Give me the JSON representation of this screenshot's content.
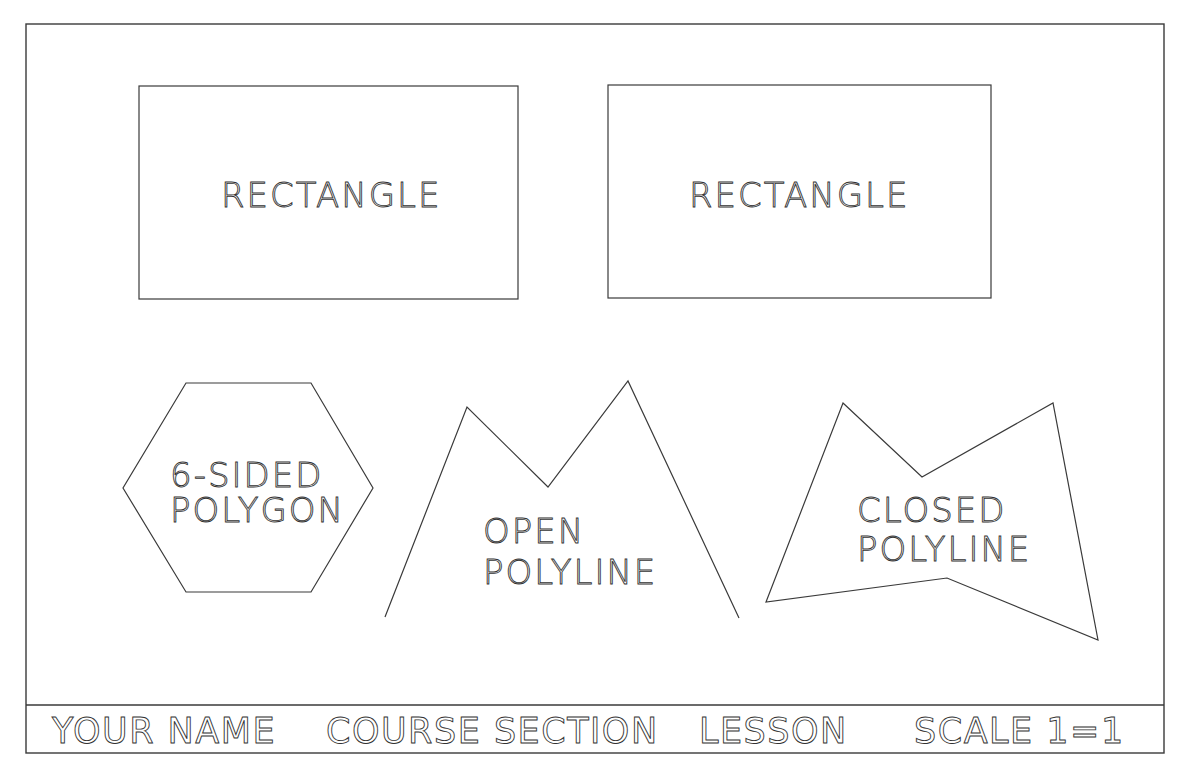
{
  "drawing": {
    "line_color": "#3a3a3a",
    "background": "#ffffff",
    "border": {
      "x": 26,
      "y": 24,
      "width": 1138,
      "height": 729
    },
    "title_block": {
      "divider_y": 705,
      "fields": [
        {
          "label": "YOUR NAME",
          "x": 52
        },
        {
          "label": "COURSE SECTION",
          "x": 326
        },
        {
          "label": "LESSON",
          "x": 699
        },
        {
          "label": "SCALE 1=1",
          "x": 914
        }
      ],
      "baseline_y": 743
    },
    "shapes": [
      {
        "type": "rectangle",
        "label_lines": [
          "RECTANGLE"
        ],
        "rect": {
          "x": 139,
          "y": 86,
          "width": 379,
          "height": 213
        },
        "label_x": 221,
        "label_y": [
          207
        ]
      },
      {
        "type": "rectangle",
        "label_lines": [
          "RECTANGLE"
        ],
        "rect": {
          "x": 608,
          "y": 85,
          "width": 383,
          "height": 213
        },
        "label_x": 689,
        "label_y": [
          207
        ]
      },
      {
        "type": "polygon",
        "sides": 6,
        "label_lines": [
          "6-SIDED",
          "POLYGON"
        ],
        "points": "186,383 311,383 373,488 311,592 186,592 123,488",
        "label_x": 170,
        "label_y": [
          487,
          522
        ]
      },
      {
        "type": "open-polyline",
        "label_lines": [
          "OPEN",
          "POLYLINE"
        ],
        "points": "385,617 467,407 548,487 628,381 739,618",
        "label_x": 483,
        "label_y": [
          543,
          584
        ]
      },
      {
        "type": "closed-polyline",
        "label_lines": [
          "CLOSED",
          "POLYLINE"
        ],
        "points": "843,403 922,477 1053,403 1098,640 947,578 766,602",
        "label_x": 857,
        "label_y": [
          522,
          561
        ]
      }
    ]
  }
}
